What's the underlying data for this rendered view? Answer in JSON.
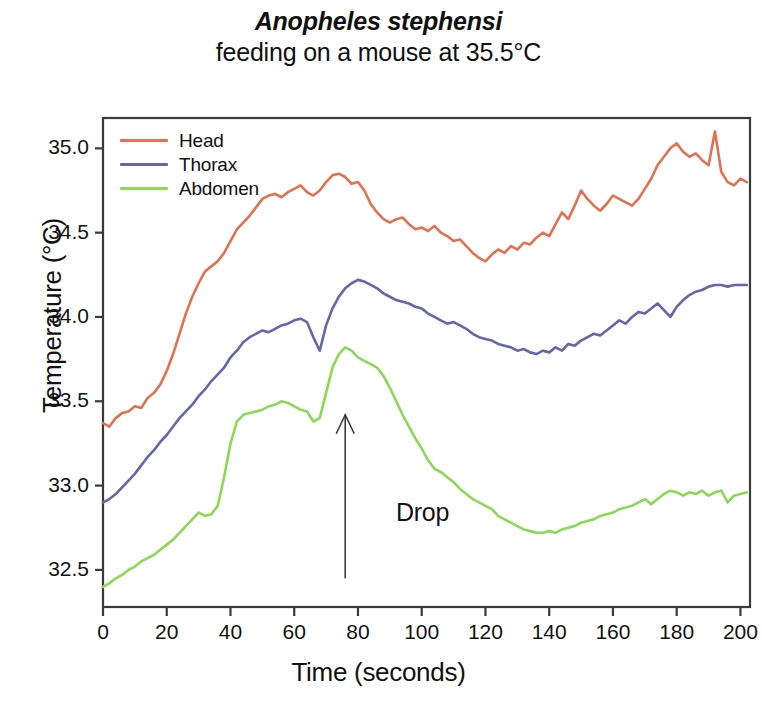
{
  "title": {
    "line1": "Anopheles stephensi",
    "line2": "feeding on a mouse at 35.5°C"
  },
  "annotations": {
    "drop_label": "Drop"
  },
  "colors": {
    "head": "#e2714f",
    "thorax": "#6266ac",
    "abdomen": "#8ada54",
    "axis": "#3a3a3a",
    "text": "#111111",
    "background": "#ffffff"
  },
  "chart_data": {
    "type": "line",
    "title": "Anopheles stephensi feeding on a mouse at 35.5°C",
    "xlabel": "Time (seconds)",
    "ylabel": "Temperature (°C)",
    "xlim": [
      0,
      203
    ],
    "ylim": [
      32.28,
      35.18
    ],
    "xticks": [
      0,
      20,
      40,
      60,
      80,
      100,
      120,
      140,
      160,
      180,
      200
    ],
    "xtick_labels": [
      "0",
      "20",
      "40",
      "60",
      "80",
      "100",
      "120",
      "140",
      "160",
      "180",
      "200"
    ],
    "yticks": [
      32.5,
      33.0,
      33.5,
      34.0,
      34.5,
      35.0
    ],
    "ytick_labels": [
      "32.5",
      "33.0",
      "33.5",
      "34.0",
      "34.5",
      "35.0"
    ],
    "grid": false,
    "legend_position": "top-left",
    "annotation": {
      "text": "Drop",
      "arrow_x": 76,
      "arrow_y_from": 32.45,
      "arrow_y_to": 33.42
    },
    "x": [
      0,
      2,
      4,
      6,
      8,
      10,
      12,
      14,
      16,
      18,
      20,
      22,
      24,
      26,
      28,
      30,
      32,
      34,
      36,
      38,
      40,
      42,
      44,
      46,
      48,
      50,
      52,
      54,
      56,
      58,
      60,
      62,
      64,
      66,
      68,
      70,
      72,
      74,
      76,
      78,
      80,
      82,
      84,
      86,
      88,
      90,
      92,
      94,
      96,
      98,
      100,
      102,
      104,
      106,
      108,
      110,
      112,
      114,
      116,
      118,
      120,
      122,
      124,
      126,
      128,
      130,
      132,
      134,
      136,
      138,
      140,
      142,
      144,
      146,
      148,
      150,
      152,
      154,
      156,
      158,
      160,
      162,
      164,
      166,
      168,
      170,
      172,
      174,
      176,
      178,
      180,
      182,
      184,
      186,
      188,
      190,
      192,
      194,
      196,
      198,
      200,
      202
    ],
    "series": [
      {
        "name": "Head",
        "color": "#e2714f",
        "values": [
          33.37,
          33.35,
          33.4,
          33.43,
          33.44,
          33.47,
          33.46,
          33.52,
          33.55,
          33.6,
          33.68,
          33.78,
          33.9,
          34.02,
          34.12,
          34.2,
          34.27,
          34.3,
          34.33,
          34.38,
          34.45,
          34.52,
          34.56,
          34.6,
          34.65,
          34.7,
          34.72,
          34.73,
          34.71,
          34.74,
          34.76,
          34.78,
          34.74,
          34.72,
          34.75,
          34.8,
          34.84,
          34.85,
          34.83,
          34.79,
          34.8,
          34.75,
          34.67,
          34.62,
          34.58,
          34.56,
          34.58,
          34.59,
          34.55,
          34.52,
          34.53,
          34.51,
          34.54,
          34.5,
          34.48,
          34.45,
          34.46,
          34.42,
          34.38,
          34.35,
          34.33,
          34.37,
          34.4,
          34.38,
          34.42,
          34.4,
          34.44,
          34.43,
          34.47,
          34.5,
          34.48,
          34.55,
          34.62,
          34.58,
          34.66,
          34.75,
          34.7,
          34.66,
          34.63,
          34.67,
          34.72,
          34.7,
          34.68,
          34.66,
          34.7,
          34.76,
          34.82,
          34.9,
          34.95,
          35.0,
          35.03,
          34.98,
          34.95,
          34.97,
          34.93,
          34.9,
          35.1,
          34.86,
          34.8,
          34.78,
          34.82,
          34.8
        ]
      },
      {
        "name": "Thorax",
        "color": "#6266ac",
        "values": [
          32.9,
          32.92,
          32.95,
          32.99,
          33.03,
          33.07,
          33.12,
          33.17,
          33.21,
          33.26,
          33.3,
          33.35,
          33.4,
          33.44,
          33.48,
          33.53,
          33.57,
          33.62,
          33.66,
          33.7,
          33.76,
          33.8,
          33.85,
          33.88,
          33.9,
          33.92,
          33.91,
          33.93,
          33.95,
          33.96,
          33.98,
          33.99,
          33.97,
          33.88,
          33.8,
          33.95,
          34.05,
          34.12,
          34.17,
          34.2,
          34.22,
          34.21,
          34.19,
          34.17,
          34.14,
          34.12,
          34.1,
          34.09,
          34.08,
          34.06,
          34.05,
          34.02,
          34.0,
          33.98,
          33.96,
          33.97,
          33.95,
          33.93,
          33.9,
          33.88,
          33.87,
          33.86,
          33.84,
          33.83,
          33.82,
          33.8,
          33.81,
          33.79,
          33.78,
          33.8,
          33.79,
          33.82,
          33.8,
          33.84,
          33.83,
          33.86,
          33.88,
          33.9,
          33.89,
          33.92,
          33.95,
          33.98,
          33.96,
          34.0,
          34.03,
          34.02,
          34.05,
          34.08,
          34.04,
          34.0,
          34.06,
          34.1,
          34.13,
          34.15,
          34.16,
          34.18,
          34.19,
          34.19,
          34.18,
          34.19,
          34.19,
          34.19
        ]
      },
      {
        "name": "Abdomen",
        "color": "#8ada54",
        "values": [
          32.4,
          32.42,
          32.45,
          32.47,
          32.5,
          32.52,
          32.55,
          32.57,
          32.59,
          32.62,
          32.65,
          32.68,
          32.72,
          32.76,
          32.8,
          32.84,
          32.82,
          32.83,
          32.88,
          33.05,
          33.25,
          33.38,
          33.42,
          33.43,
          33.44,
          33.45,
          33.47,
          33.48,
          33.5,
          33.49,
          33.47,
          33.45,
          33.44,
          33.38,
          33.4,
          33.55,
          33.7,
          33.78,
          33.82,
          33.8,
          33.76,
          33.74,
          33.72,
          33.7,
          33.65,
          33.58,
          33.5,
          33.42,
          33.35,
          33.28,
          33.22,
          33.15,
          33.1,
          33.08,
          33.05,
          33.02,
          32.98,
          32.95,
          32.92,
          32.9,
          32.88,
          32.86,
          32.82,
          32.8,
          32.78,
          32.76,
          32.74,
          32.73,
          32.72,
          32.72,
          32.73,
          32.72,
          32.74,
          32.75,
          32.76,
          32.78,
          32.79,
          32.8,
          32.82,
          32.83,
          32.84,
          32.86,
          32.87,
          32.88,
          32.9,
          32.92,
          32.89,
          32.92,
          32.95,
          32.97,
          32.96,
          32.94,
          32.96,
          32.95,
          32.97,
          32.94,
          32.96,
          32.97,
          32.9,
          32.94,
          32.95,
          32.96
        ]
      }
    ]
  },
  "legend": [
    {
      "label": "Head",
      "color": "#e2714f"
    },
    {
      "label": "Thorax",
      "color": "#6266ac"
    },
    {
      "label": "Abdomen",
      "color": "#8ada54"
    }
  ]
}
